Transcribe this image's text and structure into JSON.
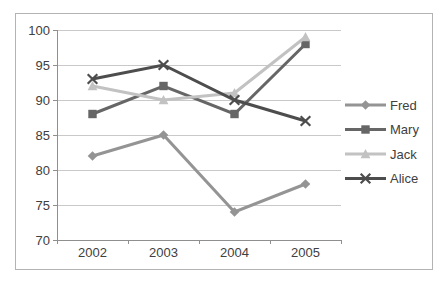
{
  "chart_data": {
    "type": "line",
    "title": "",
    "xlabel": "",
    "ylabel": "",
    "categories": [
      "2002",
      "2003",
      "2004",
      "2005"
    ],
    "series": [
      {
        "name": "Fred",
        "values": [
          82,
          85,
          74,
          78
        ],
        "color": "#949494",
        "marker": "diamond"
      },
      {
        "name": "Mary",
        "values": [
          88,
          92,
          88,
          98
        ],
        "color": "#666666",
        "marker": "square"
      },
      {
        "name": "Jack",
        "values": [
          92,
          90,
          91,
          99
        ],
        "color": "#c2c2c2",
        "marker": "triangle"
      },
      {
        "name": "Alice",
        "values": [
          93,
          95,
          90,
          87
        ],
        "color": "#4d4d4d",
        "marker": "x"
      }
    ],
    "ylim": [
      70,
      100
    ],
    "y_ticks": [
      70,
      75,
      80,
      85,
      90,
      95,
      100
    ],
    "grid": true,
    "legend_position": "right",
    "legend_labels": [
      "Fred",
      "Mary",
      "Jack",
      "Alice"
    ],
    "colors": {
      "gridline": "#c9c9c9",
      "axis": "#8f8f8f",
      "text": "#404040",
      "frame_border": "#b3b3b3",
      "background": "#ffffff"
    }
  }
}
